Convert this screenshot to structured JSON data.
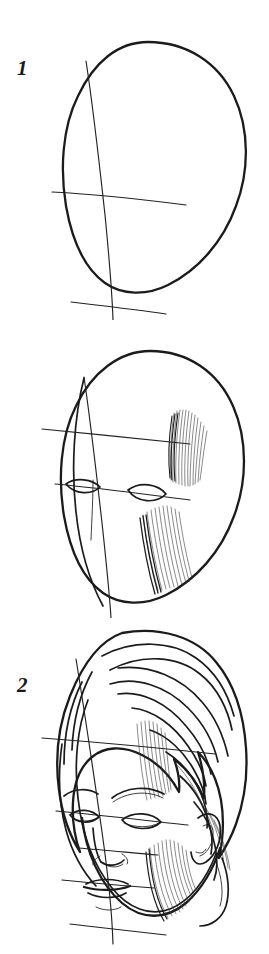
{
  "document": {
    "title": "Head Drawing Step-by-Step Tutorial",
    "medium": "pencil sketch",
    "subject": "female head, three-quarter view",
    "background_color": "#ffffff",
    "ink_color": "#1b1b1b",
    "page_width": 269,
    "page_height": 954
  },
  "steps": [
    {
      "number": "1",
      "caption": "",
      "description": "Egg-shaped head outline with vertical centre line, horizontal eye line and chin line construction guides.",
      "guides": [
        "vertical-center-line",
        "eye-line",
        "chin-line"
      ],
      "features": []
    },
    {
      "number": "2",
      "caption": "",
      "description": "Same oval with brow line added, almond eye shapes placed on the eye line, plus hatched shading for the brow ridge and the far cheek and jaw.",
      "guides": [
        "vertical-center-line",
        "brow-line",
        "eye-line",
        "nose-line",
        "chin-line",
        "profile-curve"
      ],
      "features": [
        "left-eye",
        "right-eye",
        "brow-shading",
        "cheek-shading"
      ]
    },
    {
      "number": "3",
      "caption": "",
      "description": "Finished head: hair sweeping over the forehead, eyebrows, eyes, nose, lips, ear and jaw with hatched shading, guide lines still visible.",
      "guides": [
        "vertical-center-line",
        "brow-line",
        "eye-line",
        "nose-line",
        "mouth-line",
        "chin-line"
      ],
      "features": [
        "hair",
        "eyebrows",
        "eyes",
        "nose",
        "mouth",
        "ear",
        "jaw-shading",
        "neck-line"
      ]
    }
  ],
  "labels": {
    "step1": "1",
    "step2": "2",
    "step3": "3"
  }
}
